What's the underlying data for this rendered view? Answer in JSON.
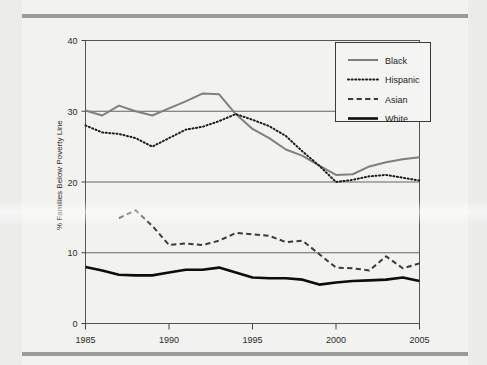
{
  "figure": {
    "background_color": "#f2f2f0",
    "plot_border_color": "#555555",
    "gridline_color": "#666666"
  },
  "chart_data": {
    "type": "line",
    "title": "",
    "subtitle": "",
    "xlabel": "",
    "ylabel": "% Families Below Poverty Line",
    "xlim": [
      1985,
      2005
    ],
    "ylim": [
      0,
      40
    ],
    "grid": true,
    "gridlines_y": [
      10,
      20,
      30,
      40
    ],
    "x_ticks": [
      1985,
      1990,
      1995,
      2000,
      2005
    ],
    "x_tick_labels": [
      "1985",
      "1990",
      "1995",
      "2000",
      "2005"
    ],
    "y_ticks": [
      0,
      10,
      20,
      30,
      40
    ],
    "y_tick_labels": [
      "0",
      "10",
      "20",
      "30",
      "40"
    ],
    "legend_position": "top-right",
    "x": [
      1985,
      1986,
      1987,
      1988,
      1989,
      1990,
      1991,
      1992,
      1993,
      1994,
      1995,
      1996,
      1997,
      1998,
      1999,
      2000,
      2001,
      2002,
      2003,
      2004,
      2005
    ],
    "series": [
      {
        "name": "Black",
        "style": "solid",
        "color": "#7f7f7f",
        "width": 2.0,
        "values": [
          30.1,
          29.4,
          30.8,
          30.0,
          29.4,
          30.4,
          31.4,
          32.5,
          32.4,
          29.6,
          27.5,
          26.2,
          24.6,
          23.7,
          22.3,
          21.0,
          21.1,
          22.2,
          22.8,
          23.2,
          23.5
        ]
      },
      {
        "name": "Hispanic",
        "style": "dotted",
        "color": "#1c1c1c",
        "width": 2.0,
        "values": [
          28.0,
          27.0,
          26.8,
          26.2,
          25.0,
          26.2,
          27.4,
          27.8,
          28.6,
          29.6,
          28.8,
          27.9,
          26.5,
          24.3,
          22.3,
          20.0,
          20.3,
          20.8,
          21.0,
          20.6,
          20.2
        ]
      },
      {
        "name": "Asian",
        "style": "dashed",
        "color": "#3a3a3a",
        "width": 2.0,
        "values": [
          null,
          null,
          14.9,
          16.0,
          13.8,
          11.1,
          11.3,
          11.1,
          11.7,
          12.8,
          12.6,
          12.4,
          11.5,
          11.7,
          9.8,
          7.9,
          7.8,
          7.5,
          9.5,
          7.8,
          8.5
        ]
      },
      {
        "name": "White",
        "style": "solid",
        "color": "#0d0d0d",
        "width": 2.6,
        "values": [
          8.0,
          7.5,
          6.9,
          6.8,
          6.8,
          7.2,
          7.6,
          7.6,
          7.9,
          7.2,
          6.5,
          6.4,
          6.4,
          6.2,
          5.5,
          5.8,
          6.0,
          6.1,
          6.2,
          6.5,
          6.0
        ]
      }
    ]
  },
  "legend": {
    "entries": [
      {
        "label": "Black"
      },
      {
        "label": "Hispanic"
      },
      {
        "label": "Asian"
      },
      {
        "label": "White"
      }
    ]
  }
}
